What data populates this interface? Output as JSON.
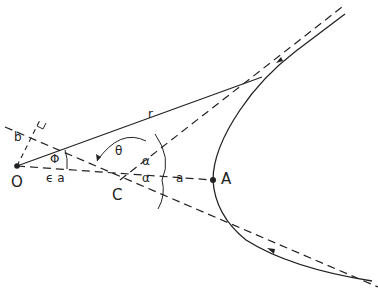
{
  "diagram": {
    "type": "hyperbolic-orbit-geometry",
    "points": {
      "O": {
        "label": "O",
        "x": 17,
        "y": 166
      },
      "C": {
        "label": "C",
        "x": 120,
        "y": 180
      },
      "A": {
        "label": "A",
        "x": 213,
        "y": 180
      }
    },
    "labels": {
      "r": "r",
      "b": "b",
      "phi": "Φ",
      "ea": "ϵ a",
      "theta": "θ",
      "alpha_upper": "α",
      "alpha_lower": "α",
      "a": "a"
    },
    "colors": {
      "stroke": "#222222",
      "background": "#ffffff"
    }
  }
}
